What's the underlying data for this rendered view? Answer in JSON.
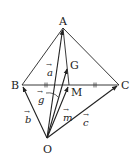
{
  "diagram": {
    "type": "vector-geometry-tetrahedron",
    "points": {
      "A": {
        "label": "A",
        "x": 63,
        "y": 28
      },
      "B": {
        "label": "B",
        "x": 22,
        "y": 85
      },
      "C": {
        "label": "C",
        "x": 119,
        "y": 85
      },
      "M": {
        "label": "M",
        "x": 69,
        "y": 85
      },
      "G": {
        "label": "G",
        "x": 68,
        "y": 67
      },
      "O": {
        "label": "O",
        "x": 47,
        "y": 138
      }
    },
    "vectors": {
      "a": {
        "label": "a",
        "arrow": "→",
        "from": "O",
        "to": "A"
      },
      "b": {
        "label": "b",
        "arrow": "→",
        "from": "O",
        "to": "B"
      },
      "c": {
        "label": "c",
        "arrow": "→",
        "from": "O",
        "to": "C"
      },
      "m": {
        "label": "m",
        "arrow": "→",
        "from": "O",
        "to": "M"
      },
      "g": {
        "label": "g",
        "arrow": "→",
        "from": "O",
        "to": "G"
      }
    },
    "tick_marks": "BM = MC",
    "colors": {
      "stroke": "#222222",
      "background": "#ffffff"
    }
  }
}
